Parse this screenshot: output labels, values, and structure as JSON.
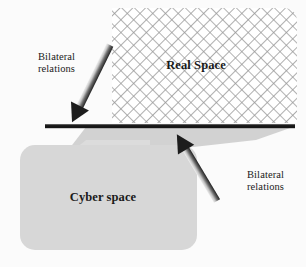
{
  "figure": {
    "background_color": "#fbfbfb",
    "canvas": {
      "width": 306,
      "height": 267
    }
  },
  "regions": {
    "real_space": {
      "label": "Real Space",
      "fill_pattern": "diagonal-cross-hatch",
      "pattern_color": "#9a9a9a",
      "fill_color": "#ffffff",
      "bounds": {
        "x": 112,
        "y": 8,
        "width": 185,
        "height": 115
      }
    },
    "cyber_space": {
      "label": "Cyber space",
      "fill_color": "#d7d7d7",
      "bounds": {
        "x": 20,
        "y": 145,
        "width": 177,
        "height": 105
      },
      "corner_radius": 14
    },
    "interface_bar": {
      "name": "boundary-bar",
      "color": "#161616",
      "x1": 45,
      "y1": 126,
      "x2": 295,
      "y2": 126,
      "thickness": 4
    },
    "shadow_wedge": {
      "name": "perspective-wedge",
      "fill_color": "#d2d2d2",
      "points": "60,160 88,128 292,128 258,139"
    }
  },
  "arrows": [
    {
      "id": "arrow-left",
      "label": "Bilateral\nrelations",
      "direction": "down-left",
      "from": {
        "x": 110,
        "y": 45
      },
      "to": {
        "x": 72,
        "y": 122
      },
      "shaft_light": "#bdbdbd",
      "shaft_dark": "#2b2b2b"
    },
    {
      "id": "arrow-right",
      "label": "Bilateral\nrelations",
      "direction": "up-right",
      "from": {
        "x": 217,
        "y": 201
      },
      "to": {
        "x": 259,
        "y": 131
      },
      "shaft_light": "#bdbdbd",
      "shaft_dark": "#2b2b2b"
    }
  ],
  "colors": {
    "text": "#1a1a1a",
    "bar": "#161616",
    "cyber_fill": "#d7d7d7",
    "wedge_fill": "#d2d2d2",
    "hatch": "#9a9a9a"
  }
}
